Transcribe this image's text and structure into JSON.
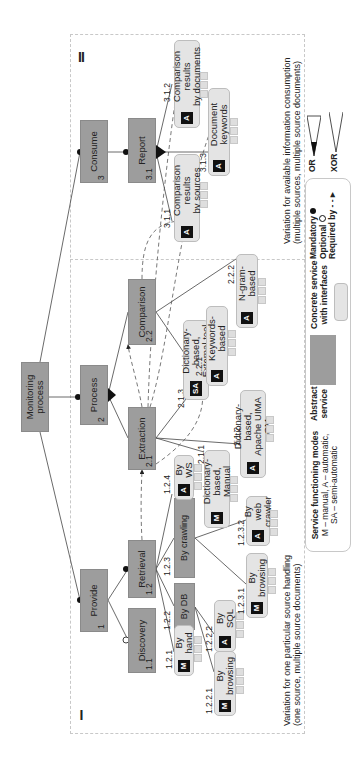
{
  "diagram": {
    "orientation": "rotated -90 degrees",
    "sections": {
      "left_mark": "I",
      "right_mark": "II",
      "left_caption": [
        "Variation for one particular source handling",
        "(one source, multiple source documents)"
      ],
      "right_caption": [
        "Variation for available information consumption",
        "(multiple sources, multiple source documents)"
      ]
    },
    "root": {
      "label": "Monitoring process"
    },
    "abstract_services": {
      "provide": {
        "num": "1",
        "label": "Provide"
      },
      "discovery": {
        "num": "1.1",
        "label": "Discovery"
      },
      "retrieval": {
        "num": "1.2",
        "label": "Retrieval"
      },
      "by_db": {
        "num": "1.2.2",
        "label": "By DB"
      },
      "by_crawling": {
        "num": "1.2.3",
        "label": "By crawling"
      },
      "process": {
        "num": "2",
        "label": "Process"
      },
      "extraction": {
        "num": "2.1",
        "label": "Extraction"
      },
      "comparison": {
        "num": "2.2",
        "label": "Comparison"
      },
      "consume": {
        "num": "3",
        "label": "Consume"
      },
      "report": {
        "num": "3.1",
        "label": "Report"
      }
    },
    "concrete_services": {
      "by_hand": {
        "num": "1.2.1",
        "mode": "M",
        "label": "By hand"
      },
      "db_by_browsing": {
        "num": "1.2.2.1",
        "mode": "M",
        "label": "By browsing"
      },
      "by_sql": {
        "num": "1.2.2.2",
        "mode": "A",
        "label": "By SQL"
      },
      "crawl_browsing": {
        "num": "1.2.3.1",
        "mode": "M",
        "label": "By browsing"
      },
      "by_web_crawler": {
        "num": "1.2.3.2",
        "mode": "A",
        "label_1": "By web",
        "label_2": "crawler"
      },
      "by_ws": {
        "num": "1.2.4",
        "mode": "A",
        "label": "By WS"
      },
      "dict_manual": {
        "num": "2.1.1",
        "mode": "M",
        "label_1": "Dictionary-based,",
        "label_2": "Manual"
      },
      "dict_uima": {
        "num": "2.1.2",
        "mode": "A",
        "label_1": "Dictionary-based,",
        "label_2": "Apache UIMA CM"
      },
      "dict_external": {
        "num": "2.1.3",
        "mode": "SA",
        "label_1": "Dictionary-based,",
        "label_2": "External tool"
      },
      "keywords_based": {
        "num": "2.2.1",
        "mode": "A",
        "label": "Keywords-based"
      },
      "ngram_based": {
        "num": "2.2.2",
        "mode": "A",
        "label": "N-gram-based"
      },
      "cmp_by_sources": {
        "num": "3.1.1",
        "mode": "A",
        "label_1": "Comparison results",
        "label_2": "by sources"
      },
      "cmp_by_documents": {
        "num": "3.1.2",
        "mode": "A",
        "label_1": "Comparison results",
        "label_2": "by documents"
      },
      "doc_keywords": {
        "num": "3.1.3",
        "mode": "A",
        "label": "Document keywords"
      }
    },
    "legend": {
      "modes_title": "Service functioning modes",
      "modes_line_1": "M – manual, A – automatic,",
      "modes_line_2": "SA – semi-automatic",
      "abstract_1": "Abstract",
      "abstract_2": "service",
      "concrete_1": "Concrete service",
      "concrete_2": "with interfaces",
      "mandatory": "Mandatory",
      "optional": "Optional",
      "required_by": "Required by",
      "or": "OR",
      "xor": "XOR"
    },
    "colors": {
      "abstract_fill": "#9d9d9d",
      "concrete_fill": "#e4e4e4",
      "mode_badge": "#111111",
      "frame": "#c8c8c8"
    }
  }
}
